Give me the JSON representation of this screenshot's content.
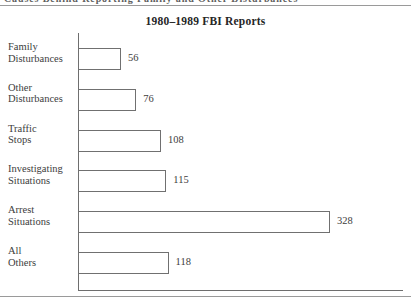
{
  "caption": {
    "text": "Causes Behind Reporting  Family  and  Other  Disturbances"
  },
  "chart_data": {
    "type": "bar",
    "orientation": "horizontal",
    "title": "1980–1989 FBI Reports",
    "xlabel": "",
    "ylabel": "",
    "grid": false,
    "legend": null,
    "xlim": [
      0,
      328
    ],
    "categories": [
      "Family Disturbances",
      "Other Disturbances",
      "Traffic Stops",
      "Investigating Situations",
      "Arrest Situations",
      "All Others"
    ],
    "values": [
      56,
      76,
      108,
      115,
      328,
      118
    ],
    "bars": [
      {
        "label_line1": "Family",
        "label_line2": "Disturbances",
        "value": 56,
        "value_text": "56"
      },
      {
        "label_line1": "Other",
        "label_line2": "Disturbances",
        "value": 76,
        "value_text": "76"
      },
      {
        "label_line1": "Traffic",
        "label_line2": "Stops",
        "value": 108,
        "value_text": "108"
      },
      {
        "label_line1": "Investigating",
        "label_line2": "Situations",
        "value": 115,
        "value_text": "115"
      },
      {
        "label_line1": "Arrest",
        "label_line2": "Situations",
        "value": 328,
        "value_text": "328"
      },
      {
        "label_line1": "All",
        "label_line2": "Others",
        "value": 118,
        "value_text": "118"
      }
    ],
    "colors": {
      "bar_fill": "#ffffff",
      "bar_stroke": "#707070",
      "axis": "#6e6e6e",
      "text": "#3d3d3d",
      "title": "#262626",
      "background": "#ffffff"
    }
  }
}
